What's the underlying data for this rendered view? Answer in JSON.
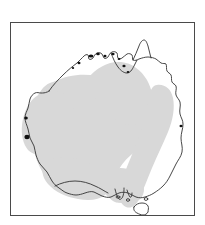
{
  "figure": {
    "kind": "distribution-map",
    "region": "Australia",
    "title": "",
    "caption": "",
    "frame": {
      "x": 10,
      "y": 22,
      "width": 185,
      "height": 194,
      "border_color": "#4a4a4a",
      "border_width_px": 1,
      "background_color": "#ffffff"
    }
  },
  "colors": {
    "page_background": "#ffffff",
    "map_background": "#ffffff",
    "coastline_stroke": "#333333",
    "coastline_accent": "#111111",
    "range_fill": "#d8d8d8",
    "range_stroke": "none",
    "frame_border": "#4a4a4a"
  },
  "map": {
    "coastline_label": "Australia mainland outline",
    "coastline_stroke_width": 0.9,
    "islands": [
      {
        "name": "Tasmania",
        "label": "Tasmania"
      },
      {
        "name": "bass-strait-island-west",
        "label": "King Island"
      },
      {
        "name": "bass-strait-island-east",
        "label": "Flinders Island"
      },
      {
        "name": "kangaroo-island",
        "label": "Kangaroo Island"
      }
    ]
  },
  "legend": {
    "present": false,
    "items": [
      {
        "swatch_color": "#d8d8d8",
        "label": "Distribution range"
      }
    ]
  },
  "range_overlay": {
    "name": "shaded-distribution-range",
    "fill": "#d8d8d8",
    "description": "Shaded range covering the arid interior and western two-thirds of the continent, with a V-shaped notch on the east and a separate northeast-southeast lobe",
    "lobes": [
      {
        "name": "western-interior-lobe",
        "label": "Western and central interior"
      },
      {
        "name": "eastern-lobe",
        "label": "Eastern inland lobe"
      }
    ]
  },
  "annotations": [],
  "axes": {
    "present": false,
    "ticks": [],
    "labels": []
  },
  "scale_bar": {
    "present": false,
    "label": ""
  },
  "north_arrow": {
    "present": false,
    "label": ""
  }
}
